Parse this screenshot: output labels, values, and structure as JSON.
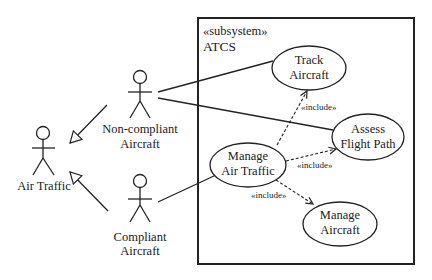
{
  "subsystem": {
    "stereotype": "«subsystem»",
    "name": "ATCS"
  },
  "actors": {
    "air_traffic": {
      "label": "Air Traffic"
    },
    "non_compliant": {
      "label_line1": "Non-compliant",
      "label_line2": "Aircraft"
    },
    "compliant": {
      "label_line1": "Compliant",
      "label_line2": "Aircraft"
    }
  },
  "use_cases": {
    "track_aircraft": {
      "line1": "Track",
      "line2": "Aircraft"
    },
    "assess_flight_path": {
      "line1": "Assess",
      "line2": "Flight Path"
    },
    "manage_air_traffic": {
      "line1": "Manage",
      "line2": "Air Traffic"
    },
    "manage_aircraft": {
      "line1": "Manage",
      "line2": "Aircraft"
    }
  },
  "relationships": {
    "include_track": "«include»",
    "include_assess": "«include»",
    "include_manage_aircraft": "«include»"
  },
  "colors": {
    "line": "#222222",
    "background": "#ffffff"
  }
}
